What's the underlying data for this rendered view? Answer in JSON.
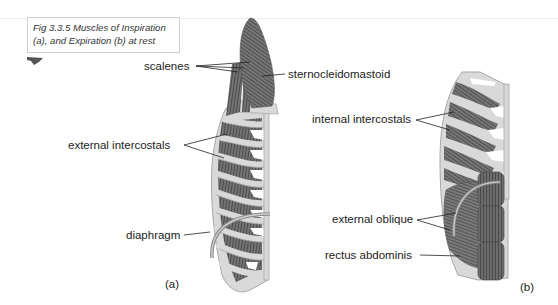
{
  "figure": {
    "caption_line1": "Fig 3.3.5 Muscles of Inspiration",
    "caption_line2": "(a), and Expiration (b) at rest"
  },
  "panel_a": {
    "label": "(a)",
    "title": "Muscles of Inspiration",
    "annotations": [
      {
        "id": "sternocleidomastoid",
        "text": "sternocleidomastoid"
      },
      {
        "id": "scalenes",
        "text": "scalenes"
      },
      {
        "id": "external-intercostals",
        "text": "external intercostals"
      },
      {
        "id": "diaphragm",
        "text": "diaphragm"
      }
    ]
  },
  "panel_b": {
    "label": "(b)",
    "title": "Muscles of Expiration",
    "annotations": [
      {
        "id": "internal-intercostals",
        "text": "internal intercostals"
      },
      {
        "id": "external-oblique",
        "text": "external oblique"
      },
      {
        "id": "rectus-abdominis",
        "text": "rectus abdominis"
      }
    ]
  },
  "colors": {
    "muscle": "#6e6e6e",
    "muscle_stripe": "#4a4a4a",
    "bone": "#d8d8d8",
    "bone_outline": "#a8a8a8",
    "leader_line": "#222222",
    "text": "#222222"
  }
}
